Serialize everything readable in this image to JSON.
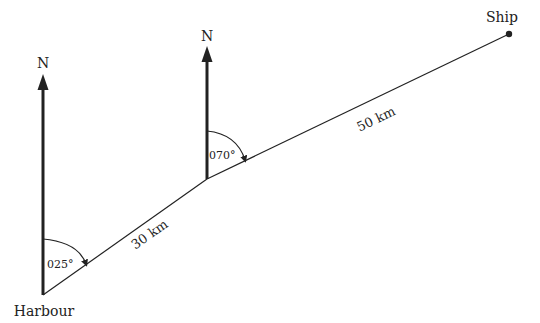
{
  "diagram": {
    "colors": {
      "line": "#222222",
      "background": "#ffffff"
    },
    "points": {
      "harbour": {
        "label": "Harbour"
      },
      "turn": {
        "label": ""
      },
      "ship": {
        "label": "Ship"
      }
    },
    "north_labels": [
      "N",
      "N"
    ],
    "legs": [
      {
        "distance_label": "30 km",
        "bearing_label": "025°"
      },
      {
        "distance_label": "50 km",
        "bearing_label": "070°"
      }
    ]
  }
}
